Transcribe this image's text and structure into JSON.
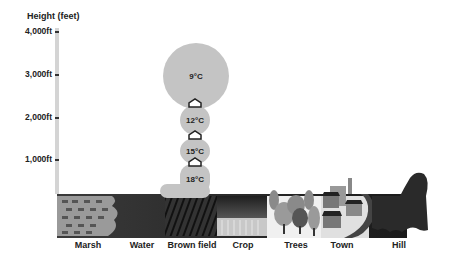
{
  "axis": {
    "title": "Height (feet)",
    "ticks": [
      {
        "label": "4,000ft",
        "value": 4000
      },
      {
        "label": "3,000ft",
        "value": 3000
      },
      {
        "label": "2,000ft",
        "value": 2000
      },
      {
        "label": "1,000ft",
        "value": 1000
      }
    ]
  },
  "thermal": {
    "bubbles": [
      {
        "label": "9°C",
        "height_ft": 3000
      },
      {
        "label": "12°C",
        "height_ft": 2000
      },
      {
        "label": "15°C",
        "height_ft": 1500
      },
      {
        "label": "18°C",
        "height_ft": 1000
      }
    ],
    "arrow_icon": "up-arrow-icon"
  },
  "ground": {
    "labels": [
      "Marsh",
      "Water",
      "Brown field",
      "Crop",
      "Trees",
      "Town",
      "Hill"
    ]
  },
  "colors": {
    "bubble": "#c4c4c4",
    "ground_dark": "#2a2a2a",
    "marsh": "#9a9a9a",
    "axis": "#d4d4d4"
  }
}
